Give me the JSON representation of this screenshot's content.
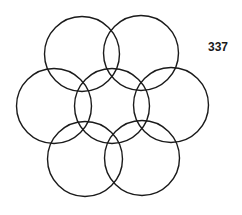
{
  "figure": {
    "label": "337",
    "stroke_color": "#1a1a1a",
    "stroke_width": 1.4,
    "radius": 37.5,
    "circles": [
      {
        "name": "center",
        "cx": 112,
        "cy": 106
      },
      {
        "name": "top-left",
        "cx": 82,
        "cy": 54
      },
      {
        "name": "top-right",
        "cx": 141,
        "cy": 53
      },
      {
        "name": "left",
        "cx": 54,
        "cy": 106
      },
      {
        "name": "right",
        "cx": 171,
        "cy": 105
      },
      {
        "name": "bottom-left",
        "cx": 85,
        "cy": 159
      },
      {
        "name": "bottom-right",
        "cx": 142,
        "cy": 158
      }
    ]
  }
}
